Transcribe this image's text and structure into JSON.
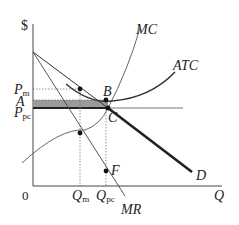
{
  "diagram": {
    "axes": {
      "y_label": "$",
      "x_label": "Q",
      "origin_label": "0"
    },
    "curves": {
      "mc": "MC",
      "atc": "ATC",
      "demand": "D",
      "mr": "MR"
    },
    "price_labels": {
      "pm_main": "P",
      "pm_sub": "m",
      "a": "A",
      "ppc_main": "P",
      "ppc_sub": "pc"
    },
    "quantity_labels": {
      "qm_main": "Q",
      "qm_sub": "m",
      "qpc_main": "Q",
      "qpc_sub": "pc"
    },
    "points": {
      "b": "B",
      "c": "C",
      "f": "F"
    },
    "colors": {
      "line": "#333333",
      "shaded_area": "#9a9a9a",
      "dotted": "#777777"
    }
  }
}
